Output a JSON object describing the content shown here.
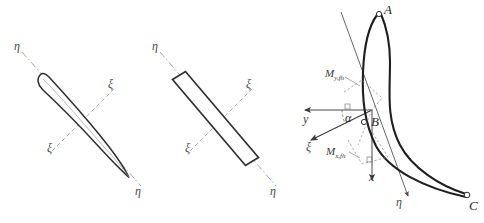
{
  "figure": {
    "background_color": "#ffffff",
    "ink_color": "#333333",
    "axis_color": "#8a8a8a",
    "panels": [
      {
        "id": "airfoil-section",
        "name": "cambered blade cross-section with principal axes",
        "labels": {
          "eta_upper": "η",
          "eta_lower": "η",
          "xi_upper": "ξ",
          "xi_lower": "ξ"
        }
      },
      {
        "id": "rectangular-section",
        "name": "rectangular bar cross-section with principal axes",
        "labels": {
          "eta_upper": "η",
          "eta_lower": "η",
          "xi_upper": "ξ",
          "xi_lower": "ξ"
        }
      },
      {
        "id": "blade-moment-diagram",
        "name": "curved turbine blade profile with coordinate systems and bending moments",
        "labels": {
          "point_a": "A",
          "point_b": "B",
          "point_c": "C",
          "axis_x": "x",
          "axis_y": "y",
          "axis_xi": "ξ",
          "axis_eta": "η",
          "angle_alpha": "α",
          "moment_y": "M",
          "moment_y_sub": "y,fh",
          "moment_x": "M",
          "moment_x_sub": "x,fh"
        }
      }
    ]
  }
}
